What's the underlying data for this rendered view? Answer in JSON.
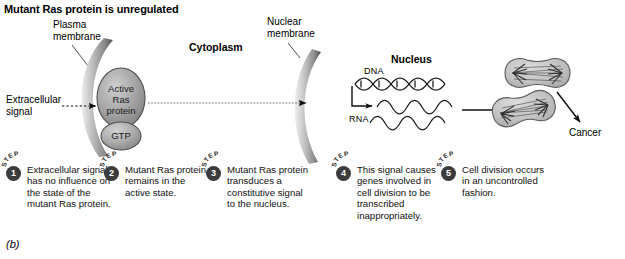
{
  "figure": {
    "title": "Mutant Ras protein is unregulated",
    "panel_letter": "(b)"
  },
  "labels": {
    "plasma_membrane": "Plasma\nmembrane",
    "plasma_membrane_line1": "Plasma",
    "plasma_membrane_line2": "membrane",
    "nuclear_membrane_line1": "Nuclear",
    "nuclear_membrane_line2": "membrane",
    "cytoplasm": "Cytoplasm",
    "nucleus": "Nucleus",
    "extracellular_signal_line1": "Extracellular",
    "extracellular_signal_line2": "signal",
    "dna": "DNA",
    "rna": "RNA",
    "cancer": "Cancer"
  },
  "molecules": {
    "ras_protein_line1": "Active",
    "ras_protein_line2": "Ras",
    "ras_protein_line3": "protein",
    "gtp": "GTP"
  },
  "steps": [
    {
      "word": "STEP",
      "number": "1",
      "text": "Extracellular signal has no influence on the state of the mutant Ras protein."
    },
    {
      "word": "STEP",
      "number": "2",
      "text": "Mutant Ras protein remains in the active state."
    },
    {
      "word": "STEP",
      "number": "3",
      "text": "Mutant Ras protein transduces a constitutive signal to the nucleus."
    },
    {
      "word": "STEP",
      "number": "4",
      "text": "This signal causes genes involved in cell division to be transcribed inappropriately."
    },
    {
      "word": "STEP",
      "number": "5",
      "text": "Cell division occurs in an uncontrolled fashion."
    }
  ],
  "colors": {
    "membrane_dark": "#6f6f6f",
    "membrane_light": "#d8d8d8",
    "protein_fill": "#9a9a9a",
    "protein_stroke": "#4d4d4d",
    "cell_fill": "#c9c9c9",
    "cell_stroke": "#5a5a5a",
    "badge": "#3b3b3b",
    "text": "#000000"
  }
}
